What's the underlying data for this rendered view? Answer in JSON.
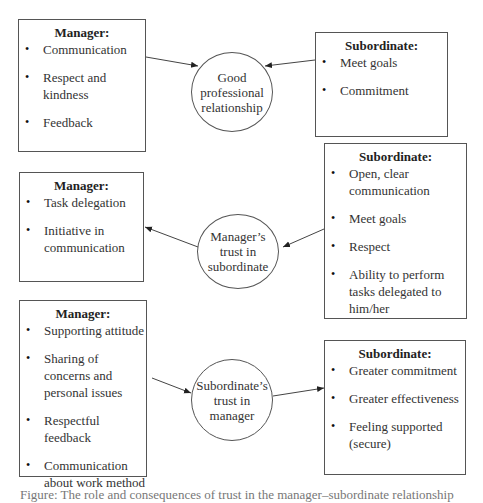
{
  "diagram": {
    "rows": [
      {
        "left_box": {
          "title": "Manager:",
          "items": [
            "Communication",
            "Respect and kindness",
            "Feedback"
          ]
        },
        "center_node": "Good professional relationship",
        "right_box": {
          "title": "Subordinate:",
          "items": [
            "Meet goals",
            "Commitment"
          ]
        }
      },
      {
        "left_box": {
          "title": "Manager:",
          "items": [
            "Task delegation",
            "Initiative in communication"
          ]
        },
        "center_node": "Manager’s trust in subordinate",
        "right_box": {
          "title": "Subordinate:",
          "items": [
            "Open, clear communication",
            "Meet goals",
            "Respect",
            "Ability to perform tasks delegated to him/her"
          ]
        }
      },
      {
        "left_box": {
          "title": "Manager:",
          "items": [
            "Supporting attitude",
            "Sharing of concerns and personal issues",
            "Respectful feedback",
            "Communication about work method"
          ]
        },
        "center_node": "Subordinate’s trust in manager",
        "right_box": {
          "title": "Subordinate:",
          "items": [
            "Greater commitment",
            "Greater effectiveness",
            "Feeling supported (secure)"
          ]
        }
      }
    ],
    "caption": "Figure: The role and consequences of trust in the manager–subordinate relationship"
  }
}
